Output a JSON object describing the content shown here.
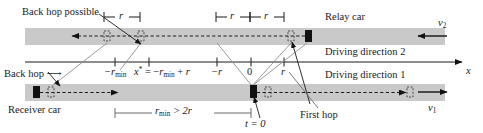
{
  "figure": {
    "type": "spatiotemporal-hop-diagram",
    "background": "#ffffff",
    "road_color": "#c9c9c9",
    "line_color": "#1a1a1a",
    "car_color": "#111111",
    "leader_color": "#8c8c8c"
  },
  "labels": {
    "back_hop_possible": "Back hop possible",
    "relay_car": "Relay car",
    "driving_direction_2": "Driving direction 2",
    "driving_direction_1": "Driving direction 1",
    "back_hop": "Back hop",
    "receiver_car": "Receiver car",
    "first_hop": "First hop",
    "axis_x": "x",
    "v2": "v",
    "v2_sub": "2",
    "v1": "v",
    "v1_sub": "1",
    "t_zero": "t = 0"
  },
  "axis": {
    "name": "x-axis",
    "ticks": [
      {
        "id": "tick-neg-rmin",
        "label_main": "−r",
        "label_sub": "min",
        "x": 115
      },
      {
        "id": "tick-xstar",
        "label_main": "x",
        "label_sub": "",
        "x": 149,
        "expression": "x* = −r_min + r"
      },
      {
        "id": "tick-neg-r",
        "label_main": "−r",
        "label_sub": "",
        "x": 217
      },
      {
        "id": "tick-zero",
        "label_main": "0",
        "label_sub": "",
        "x": 251
      },
      {
        "id": "tick-r",
        "label_main": "r",
        "label_sub": "",
        "x": 284
      }
    ]
  },
  "brackets": {
    "top_left": {
      "id": "bracket-r-left",
      "label": "r",
      "x1": 104,
      "x2": 140
    },
    "top_mid_a": {
      "id": "bracket-r-mid-a",
      "label": "r",
      "x1": 216,
      "x2": 250
    },
    "top_mid_b": {
      "id": "bracket-r-mid-b",
      "label": "r",
      "x1": 250,
      "x2": 284
    },
    "bottom": {
      "id": "bracket-rmin",
      "label_main": "r",
      "label_sub": "min",
      "label_rest": " > 2r",
      "x1": 115,
      "x2": 251
    }
  },
  "cars": {
    "relay": {
      "id": "relay-car",
      "x": 305,
      "y": 30,
      "w": 7,
      "h": 12
    },
    "receiver": {
      "id": "receiver-car",
      "x": 33,
      "y": 86,
      "w": 7,
      "h": 12
    },
    "transmitter": {
      "id": "transmitter-car",
      "x": 250,
      "y": 85,
      "w": 7,
      "h": 13
    }
  },
  "ghosts": [
    {
      "id": "ghost-top-a",
      "x": 104,
      "y": 31,
      "w": 6,
      "h": 10
    },
    {
      "id": "ghost-top-b",
      "x": 138,
      "y": 31,
      "w": 6,
      "h": 10
    },
    {
      "id": "ghost-top-c",
      "x": 288,
      "y": 31,
      "w": 6,
      "h": 10
    },
    {
      "id": "ghost-bot-a",
      "x": 48,
      "y": 87,
      "w": 6,
      "h": 10
    },
    {
      "id": "ghost-bot-b",
      "x": 265,
      "y": 87,
      "w": 6,
      "h": 10
    },
    {
      "id": "ghost-bot-c",
      "x": 407,
      "y": 87,
      "w": 6,
      "h": 10
    }
  ],
  "roads": {
    "top": {
      "x": 25,
      "y": 28,
      "w": 420,
      "h": 17
    },
    "bottom": {
      "x": 25,
      "y": 84,
      "w": 420,
      "h": 17
    }
  }
}
